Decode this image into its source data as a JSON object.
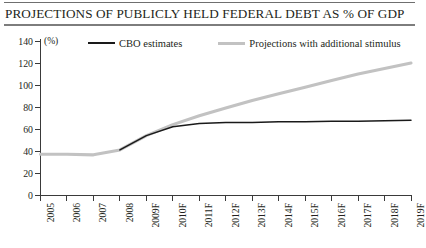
{
  "header": {
    "title": "PROJECTIONS OF PUBLICLY HELD FEDERAL DEBT AS % OF GDP"
  },
  "chart_data": {
    "type": "line",
    "title": "PROJECTIONS OF PUBLICLY HELD FEDERAL DEBT AS % OF GDP",
    "xlabel": "",
    "ylabel": "",
    "unit_label": "(%)",
    "ylim": [
      0,
      140
    ],
    "yticks": [
      0,
      20,
      40,
      60,
      80,
      100,
      120,
      140
    ],
    "grid": false,
    "legend_position": "top",
    "categories": [
      "2005",
      "2006",
      "2007",
      "2008",
      "2009F",
      "2010F",
      "2011F",
      "2012F",
      "2013F",
      "2014F",
      "2015F",
      "2016F",
      "2017F",
      "2018F",
      "2019F"
    ],
    "series": [
      {
        "name": "CBO estimates",
        "color": "#1a1a1a",
        "values": [
          null,
          null,
          null,
          41,
          54,
          62,
          65,
          66,
          66,
          66.5,
          66.5,
          67,
          67,
          67.5,
          68
        ]
      },
      {
        "name": "Projections with additional stimulus",
        "color": "#c2c2c2",
        "values": [
          37,
          37,
          36.5,
          41,
          54,
          64,
          72,
          79,
          86,
          92,
          98,
          104,
          110,
          115,
          120
        ]
      }
    ]
  },
  "legend": {
    "items": [
      {
        "label": "CBO estimates"
      },
      {
        "label": "Projections with additional stimulus"
      }
    ]
  }
}
